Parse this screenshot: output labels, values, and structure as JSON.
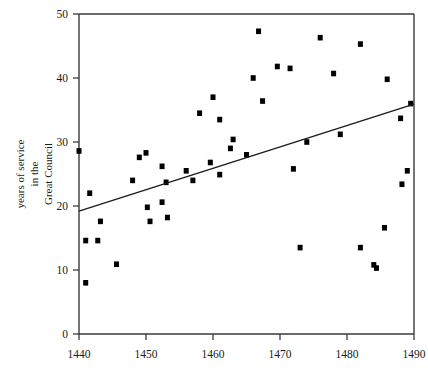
{
  "chart_data": {
    "type": "scatter",
    "title": "",
    "subtitle": "",
    "xlabel": "",
    "ylabel": "years of service in the Great Council",
    "ylabel_lines": [
      "years of service",
      "in the",
      "Great Council"
    ],
    "xlim": [
      1440,
      1490
    ],
    "ylim": [
      0,
      50
    ],
    "xticks": [
      1440,
      1450,
      1460,
      1470,
      1480,
      1490
    ],
    "xtick_labels": [
      "1440",
      "1450",
      "1460",
      "1470",
      "1480",
      "1490"
    ],
    "yticks": [
      0,
      10,
      20,
      30,
      40,
      50
    ],
    "ytick_labels": [
      "0",
      "10",
      "20",
      "30",
      "40",
      "50"
    ],
    "grid": false,
    "legend": null,
    "marker_shape": "square",
    "marker_color": "#000000",
    "points": [
      {
        "x": 1440.0,
        "y": 28.6
      },
      {
        "x": 1441.0,
        "y": 14.6
      },
      {
        "x": 1441.0,
        "y": 8.0
      },
      {
        "x": 1441.6,
        "y": 22.0
      },
      {
        "x": 1442.8,
        "y": 14.6
      },
      {
        "x": 1443.2,
        "y": 17.6
      },
      {
        "x": 1445.6,
        "y": 10.9
      },
      {
        "x": 1448.0,
        "y": 24.0
      },
      {
        "x": 1449.0,
        "y": 27.6
      },
      {
        "x": 1450.0,
        "y": 28.3
      },
      {
        "x": 1450.2,
        "y": 19.8
      },
      {
        "x": 1450.6,
        "y": 17.6
      },
      {
        "x": 1452.4,
        "y": 26.2
      },
      {
        "x": 1452.4,
        "y": 20.6
      },
      {
        "x": 1453.0,
        "y": 23.7
      },
      {
        "x": 1453.2,
        "y": 18.2
      },
      {
        "x": 1456.0,
        "y": 25.5
      },
      {
        "x": 1457.0,
        "y": 24.0
      },
      {
        "x": 1458.0,
        "y": 34.5
      },
      {
        "x": 1459.6,
        "y": 26.8
      },
      {
        "x": 1460.0,
        "y": 37.0
      },
      {
        "x": 1461.0,
        "y": 33.5
      },
      {
        "x": 1461.0,
        "y": 24.9
      },
      {
        "x": 1462.6,
        "y": 29.0
      },
      {
        "x": 1463.0,
        "y": 30.4
      },
      {
        "x": 1465.0,
        "y": 28.0
      },
      {
        "x": 1466.0,
        "y": 40.0
      },
      {
        "x": 1466.8,
        "y": 47.3
      },
      {
        "x": 1467.4,
        "y": 36.4
      },
      {
        "x": 1469.6,
        "y": 41.8
      },
      {
        "x": 1471.5,
        "y": 41.5
      },
      {
        "x": 1472.0,
        "y": 25.8
      },
      {
        "x": 1473.0,
        "y": 13.5
      },
      {
        "x": 1474.0,
        "y": 30.0
      },
      {
        "x": 1476.0,
        "y": 46.3
      },
      {
        "x": 1478.0,
        "y": 40.7
      },
      {
        "x": 1479.0,
        "y": 31.2
      },
      {
        "x": 1482.0,
        "y": 45.3
      },
      {
        "x": 1482.0,
        "y": 13.5
      },
      {
        "x": 1484.0,
        "y": 10.8
      },
      {
        "x": 1484.4,
        "y": 10.3
      },
      {
        "x": 1485.6,
        "y": 16.6
      },
      {
        "x": 1486.0,
        "y": 39.8
      },
      {
        "x": 1488.0,
        "y": 33.7
      },
      {
        "x": 1488.2,
        "y": 23.4
      },
      {
        "x": 1489.0,
        "y": 25.5
      },
      {
        "x": 1489.5,
        "y": 36.0
      }
    ],
    "trend_line": {
      "x_start": 1440,
      "y_start": 19.2,
      "x_end": 1490,
      "y_end": 35.9
    }
  }
}
